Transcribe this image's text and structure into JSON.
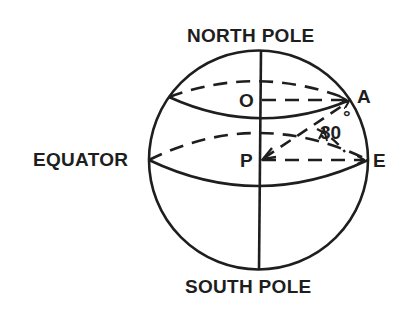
{
  "figure": {
    "type": "sphere-latitude-diagram",
    "stroke_color": "#1e1e1e",
    "background": "#ffffff",
    "labels": {
      "north_pole": "NORTH POLE",
      "south_pole": "SOUTH POLE",
      "equator": "EQUATOR",
      "point_o": "O",
      "point_a": "A",
      "point_p": "P",
      "point_e": "E",
      "angle_value": "30",
      "angle_degree": "°"
    },
    "angle_deg": 30,
    "elements": [
      "sphere outline",
      "polar axis (north pole to south pole)",
      "latitude circle through A (front solid, back dashed)",
      "equator circle through E (front solid, back dashed)",
      "dashed radius O to A",
      "dashed radius P to E",
      "dashed line P to A",
      "30 degree angle marker between PA and PE"
    ]
  }
}
